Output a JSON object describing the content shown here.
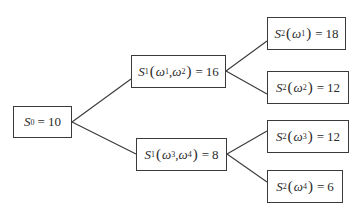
{
  "diagram": {
    "type": "binomial-tree",
    "nodes": [
      {
        "id": "s0",
        "symbol": "S",
        "sub": "0",
        "args": [],
        "value": "10"
      },
      {
        "id": "s1-up",
        "symbol": "S",
        "sub": "1",
        "args": [
          {
            "w": "ω",
            "sub": "1"
          },
          {
            "w": "ω",
            "sub": "2"
          }
        ],
        "value": "16"
      },
      {
        "id": "s1-down",
        "symbol": "S",
        "sub": "1",
        "args": [
          {
            "w": "ω",
            "sub": "3"
          },
          {
            "w": "ω",
            "sub": "4"
          }
        ],
        "value": "8"
      },
      {
        "id": "s2-w1",
        "symbol": "S",
        "sub": "2",
        "args": [
          {
            "w": "ω",
            "sub": "1"
          }
        ],
        "value": "18"
      },
      {
        "id": "s2-w2",
        "symbol": "S",
        "sub": "2",
        "args": [
          {
            "w": "ω",
            "sub": "2"
          }
        ],
        "value": "12"
      },
      {
        "id": "s2-w3",
        "symbol": "S",
        "sub": "2",
        "args": [
          {
            "w": "ω",
            "sub": "3"
          }
        ],
        "value": "12"
      },
      {
        "id": "s2-w4",
        "symbol": "S",
        "sub": "2",
        "args": [
          {
            "w": "ω",
            "sub": "4"
          }
        ],
        "value": "6"
      }
    ],
    "edges": [
      [
        "s0",
        "s1-up"
      ],
      [
        "s0",
        "s1-down"
      ],
      [
        "s1-up",
        "s2-w1"
      ],
      [
        "s1-up",
        "s2-w2"
      ],
      [
        "s1-down",
        "s2-w3"
      ],
      [
        "s1-down",
        "s2-w4"
      ]
    ],
    "labels": {
      "s0": {
        "S": "S",
        "sub": "0",
        "eq": "=",
        "value": "10"
      },
      "s1_up": {
        "S": "S",
        "sub": "1",
        "open": "(",
        "w1": "ω",
        "w1_sub": "1",
        "comma": ",",
        "w2": "ω",
        "w2_sub": "2",
        "close": ")",
        "eq": "=",
        "value": "16"
      },
      "s1_down": {
        "S": "S",
        "sub": "1",
        "open": "(",
        "w1": "ω",
        "w1_sub": "3",
        "comma": ",",
        "w2": "ω",
        "w2_sub": "4",
        "close": ")",
        "eq": "=",
        "value": "8"
      },
      "s2_w1": {
        "S": "S",
        "sub": "2",
        "open": "(",
        "w": "ω",
        "w_sub": "1",
        "close": ")",
        "eq": "=",
        "value": "18"
      },
      "s2_w2": {
        "S": "S",
        "sub": "2",
        "open": "(",
        "w": "ω",
        "w_sub": "2",
        "close": ")",
        "eq": "=",
        "value": "12"
      },
      "s2_w3": {
        "S": "S",
        "sub": "2",
        "open": "(",
        "w": "ω",
        "w_sub": "3",
        "close": ")",
        "eq": "=",
        "value": "12"
      },
      "s2_w4": {
        "S": "S",
        "sub": "2",
        "open": "(",
        "w": "ω",
        "w_sub": "4",
        "close": ")",
        "eq": "=",
        "value": "6"
      }
    },
    "colors": {
      "line": "#3a3a3a",
      "text": "#2a2a2a",
      "background": "#ffffff"
    }
  }
}
